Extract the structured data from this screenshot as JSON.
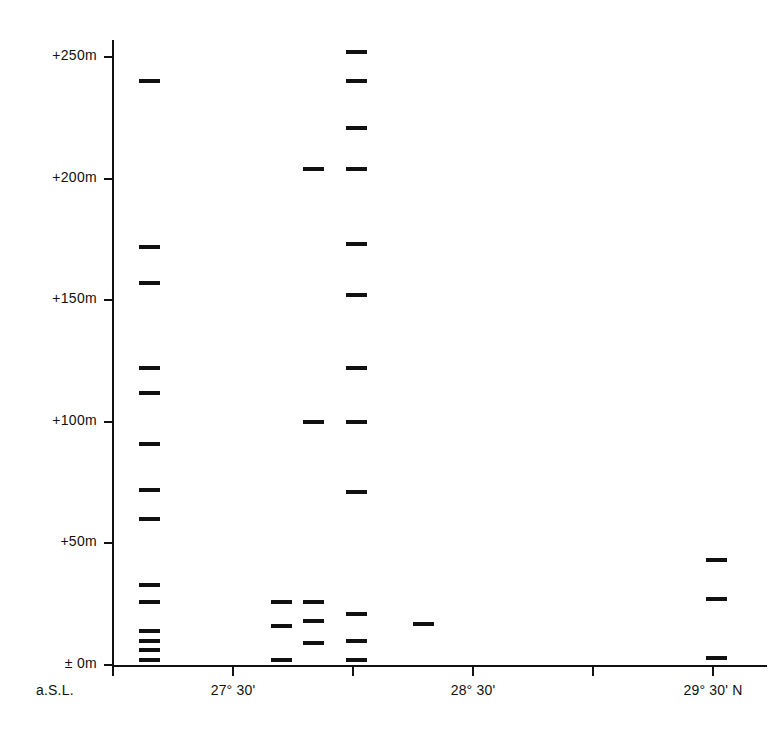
{
  "chart_data": {
    "type": "scatter",
    "title": "",
    "xlabel": "",
    "ylabel": "",
    "origin_label": "a.S.L.",
    "xlim": [
      27.0,
      30.0
    ],
    "ylim": [
      -5,
      262
    ],
    "grid": false,
    "legend": null,
    "y_axis": {
      "unit": "m",
      "ticks": [
        {
          "value": 0,
          "label": "±  0m"
        },
        {
          "value": 50,
          "label": "+50m"
        },
        {
          "value": 100,
          "label": "+100m"
        },
        {
          "value": 150,
          "label": "+150m"
        },
        {
          "value": 200,
          "label": "+200m"
        },
        {
          "value": 250,
          "label": "+250m"
        }
      ]
    },
    "x_axis": {
      "unit": "degrees north latitude",
      "ticks": [
        {
          "value": 27.0,
          "label": ""
        },
        {
          "value": 27.5,
          "label": "27° 30'"
        },
        {
          "value": 28.0,
          "label": ""
        },
        {
          "value": 28.5,
          "label": "28° 30'"
        },
        {
          "value": 29.0,
          "label": ""
        },
        {
          "value": 29.5,
          "label": "29° 30' N"
        }
      ]
    },
    "marks": [
      {
        "x": 27.11,
        "y": 240
      },
      {
        "x": 27.11,
        "y": 172
      },
      {
        "x": 27.11,
        "y": 157
      },
      {
        "x": 27.11,
        "y": 122
      },
      {
        "x": 27.11,
        "y": 112
      },
      {
        "x": 27.11,
        "y": 91
      },
      {
        "x": 27.11,
        "y": 72
      },
      {
        "x": 27.11,
        "y": 60
      },
      {
        "x": 27.11,
        "y": 33
      },
      {
        "x": 27.11,
        "y": 26
      },
      {
        "x": 27.11,
        "y": 14
      },
      {
        "x": 27.11,
        "y": 10
      },
      {
        "x": 27.11,
        "y": 6
      },
      {
        "x": 27.11,
        "y": 2
      },
      {
        "x": 27.66,
        "y": 26
      },
      {
        "x": 27.66,
        "y": 16
      },
      {
        "x": 27.66,
        "y": 2
      },
      {
        "x": 27.79,
        "y": 204
      },
      {
        "x": 27.79,
        "y": 100
      },
      {
        "x": 27.79,
        "y": 26
      },
      {
        "x": 27.79,
        "y": 18
      },
      {
        "x": 27.79,
        "y": 9
      },
      {
        "x": 27.97,
        "y": 252
      },
      {
        "x": 27.97,
        "y": 240
      },
      {
        "x": 27.97,
        "y": 221
      },
      {
        "x": 27.97,
        "y": 204
      },
      {
        "x": 27.97,
        "y": 173
      },
      {
        "x": 27.97,
        "y": 152
      },
      {
        "x": 27.97,
        "y": 122
      },
      {
        "x": 27.97,
        "y": 100
      },
      {
        "x": 27.97,
        "y": 71
      },
      {
        "x": 27.97,
        "y": 21
      },
      {
        "x": 27.97,
        "y": 10
      },
      {
        "x": 27.97,
        "y": 2
      },
      {
        "x": 28.25,
        "y": 17
      },
      {
        "x": 29.47,
        "y": 43
      },
      {
        "x": 29.47,
        "y": 27
      },
      {
        "x": 29.47,
        "y": 3
      }
    ],
    "colors": {
      "ink": "#111111",
      "background": "#ffffff"
    }
  }
}
